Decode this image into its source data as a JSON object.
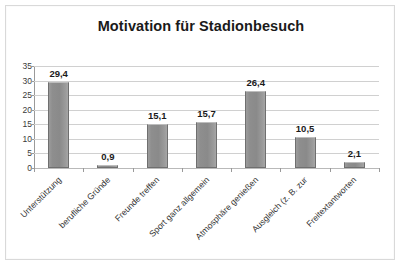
{
  "chart_data": {
    "type": "bar",
    "title": "Motivation für Stadionbesuch",
    "xlabel": "",
    "ylabel": "",
    "ylim": [
      0,
      35
    ],
    "yticks": [
      "0",
      "5",
      "10",
      "15",
      "20",
      "25",
      "30",
      "35"
    ],
    "grid": true,
    "legend": "none",
    "label_rotation": -45,
    "categories": [
      "Unterstützung",
      "berufliche Gründe",
      "Freunde treffen",
      "Sport ganz allgemein",
      "Atmosphäre genießen",
      "Ausgleich (z. B. zur",
      "Freitextantworten"
    ],
    "values": [
      29.4,
      0.9,
      15.1,
      15.7,
      26.4,
      10.5,
      2.1
    ],
    "value_labels": [
      "29,4",
      "0,9",
      "15,1",
      "15,7",
      "26,4",
      "10,5",
      "2,1"
    ],
    "series": [
      {
        "name": "Motivation",
        "values": [
          29.4,
          0.9,
          15.1,
          15.7,
          26.4,
          10.5,
          2.1
        ]
      }
    ],
    "colors": {
      "bar_fill": "#8e8e8e",
      "bar_border": "#6f6f6f",
      "gridline": "#d0d0d0",
      "axis": "#9a9a9a",
      "title_text": "#1a1a1a",
      "label_text": "#333333",
      "plot_background": "#ffffff",
      "frame_border": "#d9d9d9"
    }
  }
}
